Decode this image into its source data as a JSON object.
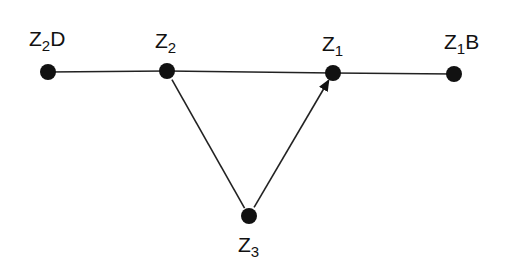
{
  "diagram": {
    "nodes": [
      {
        "id": "Z2D",
        "base": "Z",
        "sub": "2",
        "suffix": "D",
        "x": 48,
        "y": 72,
        "label_x": 29,
        "label_y": 28
      },
      {
        "id": "Z2",
        "base": "Z",
        "sub": "2",
        "suffix": "",
        "x": 167,
        "y": 71,
        "label_x": 155,
        "label_y": 30
      },
      {
        "id": "Z1",
        "base": "Z",
        "sub": "1",
        "suffix": "",
        "x": 333,
        "y": 73,
        "label_x": 322,
        "label_y": 33
      },
      {
        "id": "Z1B",
        "base": "Z",
        "sub": "1",
        "suffix": "B",
        "x": 454,
        "y": 74,
        "label_x": 444,
        "label_y": 31
      },
      {
        "id": "Z3",
        "base": "Z",
        "sub": "3",
        "suffix": "",
        "x": 249,
        "y": 216,
        "label_x": 238,
        "label_y": 234
      }
    ],
    "edges": [
      {
        "from": "Z2D",
        "to": "Z2",
        "arrow": false
      },
      {
        "from": "Z2",
        "to": "Z1",
        "arrow": false
      },
      {
        "from": "Z1",
        "to": "Z1B",
        "arrow": false
      },
      {
        "from": "Z2",
        "to": "Z3",
        "arrow": false
      },
      {
        "from": "Z3",
        "to": "Z1",
        "arrow": true
      }
    ],
    "colors": {
      "node": "#111111",
      "edge": "#222222"
    }
  }
}
